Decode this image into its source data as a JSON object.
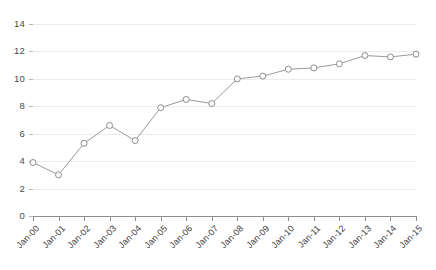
{
  "chart_data": {
    "type": "line",
    "title": "",
    "subtitle": "",
    "xlabel": "",
    "ylabel": "",
    "categories": [
      "Jan-00",
      "Jan-01",
      "Jan-02",
      "Jan-03",
      "Jan-04",
      "Jan-05",
      "Jan-06",
      "Jan-07",
      "Jan-08",
      "Jan-09",
      "Jan-10",
      "Jan-11",
      "Jan-12",
      "Jan-13",
      "Jan-14",
      "Jan-15"
    ],
    "values": [
      3.9,
      3.0,
      5.3,
      6.6,
      5.5,
      7.9,
      8.5,
      8.2,
      10.0,
      10.2,
      10.7,
      10.8,
      11.1,
      11.7,
      11.6,
      11.8
    ],
    "series": [
      {
        "name": "",
        "values": [
          3.9,
          3.0,
          5.3,
          6.6,
          5.5,
          7.9,
          8.5,
          8.2,
          10.0,
          10.2,
          10.7,
          10.8,
          11.1,
          11.7,
          11.6,
          11.8
        ]
      }
    ],
    "ylim": [
      0,
      14
    ],
    "yticks": [
      0,
      2,
      4,
      6,
      8,
      10,
      12,
      14
    ],
    "ytick_labels": [
      "0",
      "2",
      "4",
      "6",
      "8",
      "10",
      "12",
      "14"
    ],
    "grid": true,
    "grid_axis": "y",
    "legend": false,
    "legend_position": "none",
    "marker": "open-circle",
    "xtick_label_rotation": -45,
    "colors": {
      "line": "#9a9a9a",
      "marker_fill": "#ffffff",
      "marker_stroke": "#8d8d8d",
      "gridline": "#ececed",
      "axis": "#8e8e8e",
      "tick_text": "#3c3c3c",
      "background": "#ffffff"
    }
  }
}
